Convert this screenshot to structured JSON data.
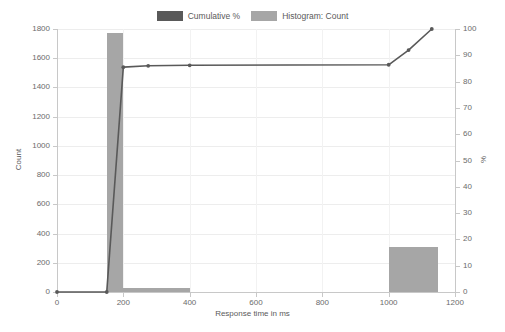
{
  "legend": {
    "position": "top-center",
    "entries": [
      {
        "label": "Cumulative %",
        "color": "#595959",
        "swatch_name": "legend-swatch-cumulative"
      },
      {
        "label": "Histogram: Count",
        "color": "#a6a6a6",
        "swatch_name": "legend-swatch-histogram"
      }
    ]
  },
  "chart_data": {
    "type": "bar",
    "title": "",
    "subtitle": "",
    "xlabel": "Response time in ms",
    "ylabel": "Count",
    "y2label": "%",
    "xlim": [
      0,
      1200
    ],
    "ylim": [
      0,
      1800
    ],
    "y2lim": [
      0,
      100
    ],
    "xticks": [
      0,
      200,
      400,
      600,
      800,
      1000,
      1200
    ],
    "yticks": [
      0,
      200,
      400,
      600,
      800,
      1000,
      1200,
      1400,
      1600,
      1800
    ],
    "y2ticks": [
      0,
      10,
      20,
      30,
      40,
      50,
      60,
      70,
      80,
      90,
      100
    ],
    "grid": true,
    "series": [
      {
        "name": "Histogram: Count",
        "type": "bar",
        "axis": "left",
        "color": "#a6a6a6",
        "bins": [
          {
            "x_start": 150,
            "x_end": 200,
            "value": 1770
          },
          {
            "x_start": 200,
            "x_end": 400,
            "value": 25
          },
          {
            "x_start": 1000,
            "x_end": 1150,
            "value": 305
          }
        ]
      },
      {
        "name": "Cumulative %",
        "type": "line",
        "axis": "right",
        "color": "#595959",
        "points": [
          {
            "x": 0,
            "y": 0
          },
          {
            "x": 150,
            "y": 0
          },
          {
            "x": 200,
            "y": 85.5
          },
          {
            "x": 275,
            "y": 86
          },
          {
            "x": 400,
            "y": 86.2
          },
          {
            "x": 1000,
            "y": 86.4
          },
          {
            "x": 1060,
            "y": 92
          },
          {
            "x": 1130,
            "y": 100
          }
        ]
      }
    ]
  },
  "axis_titles": {
    "x": "Response time in ms",
    "y_left": "Count",
    "y_right": "%"
  }
}
